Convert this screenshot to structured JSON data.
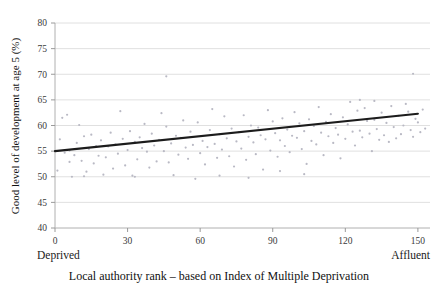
{
  "chart_data": {
    "type": "scatter",
    "title": "",
    "xlabel": "Local authority rank – based on Index of Multiple Deprivation",
    "ylabel": "Good level of development at age 5 (%)",
    "xlim": [
      0,
      155
    ],
    "ylim": [
      40,
      80
    ],
    "grid": "horizontal",
    "legend": "none",
    "x_ticks": [
      0,
      30,
      60,
      90,
      120,
      150
    ],
    "x_tick_labels": [
      "0",
      "30",
      "60",
      "90",
      "120",
      "150"
    ],
    "y_ticks": [
      40,
      45,
      50,
      55,
      60,
      65,
      70,
      75,
      80
    ],
    "y_tick_labels": [
      "40",
      "45",
      "50",
      "55",
      "60",
      "65",
      "70",
      "75",
      "80"
    ],
    "x_axis_end_labels": {
      "left": "Deprived",
      "right": "Affluent"
    },
    "point_color": "#b9b9c4",
    "trendline_color": "#1c1c1c",
    "gridline_color": "#d8d8d8",
    "series": [
      {
        "name": "Local authorities",
        "type": "scatter",
        "points": [
          [
            1,
            51.2
          ],
          [
            2,
            57.3
          ],
          [
            3,
            61.5
          ],
          [
            4,
            54.7
          ],
          [
            5,
            62.1
          ],
          [
            6,
            55.1
          ],
          [
            7,
            50.0
          ],
          [
            8,
            54.2
          ],
          [
            9,
            56.6
          ],
          [
            10,
            60.1
          ],
          [
            11,
            53.1
          ],
          [
            12,
            57.9
          ],
          [
            13,
            51.0
          ],
          [
            14,
            55.4
          ],
          [
            15,
            58.2
          ],
          [
            16,
            52.6
          ],
          [
            17,
            56.0
          ],
          [
            18,
            54.1
          ],
          [
            19,
            57.1
          ],
          [
            20,
            50.4
          ],
          [
            21,
            53.8
          ],
          [
            22,
            55.9
          ],
          [
            23,
            58.6
          ],
          [
            24,
            51.6
          ],
          [
            25,
            56.3
          ],
          [
            26,
            54.5
          ],
          [
            27,
            62.8
          ],
          [
            28,
            57.4
          ],
          [
            29,
            52.2
          ],
          [
            30,
            55.2
          ],
          [
            31,
            58.9
          ],
          [
            32,
            50.2
          ],
          [
            33,
            56.8
          ],
          [
            34,
            53.4
          ],
          [
            35,
            57.7
          ],
          [
            36,
            55.6
          ],
          [
            37,
            60.3
          ],
          [
            38,
            54.9
          ],
          [
            39,
            51.8
          ],
          [
            40,
            58.4
          ],
          [
            41,
            56.1
          ],
          [
            42,
            53.0
          ],
          [
            43,
            57.2
          ],
          [
            44,
            62.4
          ],
          [
            45,
            55.0
          ],
          [
            46,
            59.8
          ],
          [
            47,
            52.8
          ],
          [
            48,
            56.5
          ],
          [
            49,
            50.3
          ],
          [
            50,
            58.0
          ],
          [
            51,
            54.3
          ],
          [
            52,
            57.6
          ],
          [
            53,
            61.0
          ],
          [
            54,
            55.7
          ],
          [
            55,
            53.5
          ],
          [
            56,
            58.8
          ],
          [
            57,
            56.2
          ],
          [
            58,
            49.6
          ],
          [
            59,
            60.6
          ],
          [
            60,
            54.6
          ],
          [
            61,
            57.0
          ],
          [
            62,
            52.4
          ],
          [
            63,
            55.8
          ],
          [
            64,
            59.1
          ],
          [
            65,
            63.2
          ],
          [
            66,
            56.4
          ],
          [
            67,
            53.7
          ],
          [
            68,
            58.3
          ],
          [
            69,
            55.3
          ],
          [
            70,
            61.8
          ],
          [
            71,
            57.5
          ],
          [
            72,
            54.0
          ],
          [
            73,
            59.4
          ],
          [
            74,
            52.0
          ],
          [
            75,
            56.9
          ],
          [
            76,
            58.7
          ],
          [
            77,
            55.5
          ],
          [
            78,
            62.0
          ],
          [
            79,
            53.3
          ],
          [
            80,
            57.8
          ],
          [
            81,
            60.0
          ],
          [
            82,
            56.7
          ],
          [
            83,
            54.4
          ],
          [
            84,
            59.6
          ],
          [
            85,
            58.1
          ],
          [
            86,
            51.4
          ],
          [
            87,
            57.3
          ],
          [
            88,
            63.0
          ],
          [
            89,
            55.1
          ],
          [
            90,
            60.8
          ],
          [
            91,
            58.5
          ],
          [
            92,
            53.9
          ],
          [
            93,
            57.1
          ],
          [
            94,
            61.4
          ],
          [
            95,
            56.0
          ],
          [
            96,
            59.2
          ],
          [
            97,
            54.8
          ],
          [
            98,
            58.0
          ],
          [
            99,
            62.6
          ],
          [
            100,
            57.6
          ],
          [
            101,
            60.4
          ],
          [
            102,
            55.4
          ],
          [
            103,
            58.9
          ],
          [
            104,
            52.5
          ],
          [
            105,
            61.2
          ],
          [
            106,
            57.0
          ],
          [
            107,
            59.9
          ],
          [
            108,
            56.3
          ],
          [
            109,
            63.6
          ],
          [
            110,
            58.6
          ],
          [
            111,
            54.2
          ],
          [
            112,
            60.7
          ],
          [
            113,
            57.9
          ],
          [
            114,
            62.2
          ],
          [
            115,
            56.6
          ],
          [
            116,
            59.5
          ],
          [
            117,
            58.2
          ],
          [
            118,
            53.6
          ],
          [
            119,
            61.6
          ],
          [
            120,
            57.4
          ],
          [
            121,
            60.2
          ],
          [
            122,
            64.6
          ],
          [
            123,
            58.8
          ],
          [
            124,
            56.1
          ],
          [
            125,
            62.9
          ],
          [
            126,
            59.0
          ],
          [
            127,
            57.7
          ],
          [
            128,
            63.4
          ],
          [
            129,
            60.9
          ],
          [
            130,
            58.4
          ],
          [
            131,
            55.0
          ],
          [
            132,
            61.1
          ],
          [
            133,
            59.3
          ],
          [
            134,
            57.2
          ],
          [
            135,
            62.5
          ],
          [
            136,
            58.1
          ],
          [
            137,
            60.5
          ],
          [
            138,
            56.8
          ],
          [
            139,
            63.8
          ],
          [
            140,
            59.7
          ],
          [
            141,
            57.5
          ],
          [
            142,
            61.9
          ],
          [
            143,
            58.3
          ],
          [
            144,
            60.0
          ],
          [
            145,
            64.2
          ],
          [
            146,
            62.7
          ],
          [
            147,
            59.1
          ],
          [
            148,
            57.8
          ],
          [
            149,
            61.3
          ],
          [
            150,
            60.6
          ],
          [
            151,
            58.7
          ],
          [
            152,
            63.1
          ],
          [
            153,
            59.4
          ],
          [
            80,
            49.8
          ],
          [
            46,
            69.6
          ],
          [
            12,
            50.1
          ],
          [
            33,
            50.0
          ],
          [
            68,
            50.2
          ],
          [
            103,
            50.5
          ],
          [
            6,
            52.9
          ],
          [
            132,
            64.8
          ],
          [
            126,
            65.0
          ],
          [
            93,
            51.1
          ],
          [
            148,
            70.1
          ]
        ]
      },
      {
        "name": "Linear trend",
        "type": "line",
        "points": [
          [
            0,
            55.0
          ],
          [
            150,
            62.3
          ]
        ]
      }
    ]
  }
}
